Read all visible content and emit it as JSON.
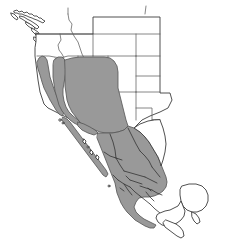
{
  "figure": {
    "type": "distribution-range-map",
    "region_name": "Western North America",
    "width": 229,
    "height": 242,
    "background_color": "#ffffff"
  },
  "legend": {
    "range_fill_color": "#999999",
    "range_border_color": "#5a5a5a",
    "land_fill_color": "#ffffff",
    "land_border_color": "#3c3c3c",
    "subdivision_line_color": "#5d5d5d"
  },
  "areas": {
    "shaded_range_label": "shaded distribution range",
    "unshaded_land_label": "unshaded land area"
  },
  "geography": {
    "countries": [
      {
        "name": "United States",
        "shaded": "partial"
      },
      {
        "name": "Mexico",
        "shaded": "mostly"
      },
      {
        "name": "Canada",
        "shaded": "none"
      }
    ],
    "shaded_regions": [
      "Pacific Coast Ranges",
      "Sierra Nevada",
      "Great Basin",
      "Colorado Plateau",
      "Arizona",
      "New Mexico",
      "Baja California",
      "Sonora",
      "Chihuahua",
      "Sierra Madre Occidental",
      "Sierra Madre Oriental",
      "Central Mexican Plateau",
      "Oaxaca"
    ],
    "unshaded_regions": [
      "Pacific Northwest",
      "Idaho",
      "Montana",
      "Wyoming",
      "Colorado",
      "Central Valley of California",
      "Eastern Texas",
      "Yucatan Peninsula",
      "Gulf Coastal Plain"
    ]
  },
  "shapes": {
    "us_states_outline": "M 93 17 L 93 48 M 60 25 L 93 25 M 93 25 L 160 25 M 148 25 L 148 8 M 145 14 L 146 5 M 118 25 L 118 48 M 93 48 L 160 48 M 160 25 L 160 48",
    "mexico_note": "states of Mexico subdivided by thin dark lines"
  }
}
